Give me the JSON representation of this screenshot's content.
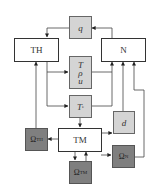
{
  "diagram": {
    "nodes": {
      "q": {
        "label": "q",
        "style": "light"
      },
      "TH": {
        "label": "TH",
        "style": "white"
      },
      "N": {
        "label": "N",
        "style": "white"
      },
      "state": {
        "lines": [
          "T",
          "ρ",
          "u"
        ],
        "style": "light"
      },
      "Te": {
        "label": "T",
        "sub": "e",
        "style": "light"
      },
      "d": {
        "label": "d",
        "style": "light"
      },
      "TM": {
        "label": "TM",
        "style": "white"
      },
      "Omega_TH": {
        "label": "Ω",
        "sub": "TH",
        "style": "dark"
      },
      "Omega_N": {
        "label": "Ω",
        "sub": "N",
        "style": "dark"
      },
      "Omega_TM": {
        "label": "Ω",
        "sub": "TM",
        "style": "dark"
      }
    },
    "edges": [
      {
        "from": "N",
        "to": "q"
      },
      {
        "from": "q",
        "to": "TH"
      },
      {
        "from": "TH",
        "to": "state"
      },
      {
        "from": "state",
        "to": "N"
      },
      {
        "from": "TH",
        "to": "Te"
      },
      {
        "from": "Te",
        "to": "TM"
      },
      {
        "from": "TM",
        "to": "d"
      },
      {
        "from": "d",
        "to": "N"
      },
      {
        "from": "TM",
        "to": "Omega_TH"
      },
      {
        "from": "Omega_TH",
        "to": "TH"
      },
      {
        "from": "TM",
        "to": "Omega_N"
      },
      {
        "from": "Omega_N",
        "to": "N"
      },
      {
        "from": "TM",
        "to": "Omega_TM"
      },
      {
        "from": "Omega_TM",
        "to": "TM"
      },
      {
        "from": "N",
        "to": "Te"
      }
    ],
    "colors": {
      "white": "#ffffff",
      "light": "#d4d4d4",
      "dark": "#7f7f7f",
      "line": "#333333"
    }
  }
}
